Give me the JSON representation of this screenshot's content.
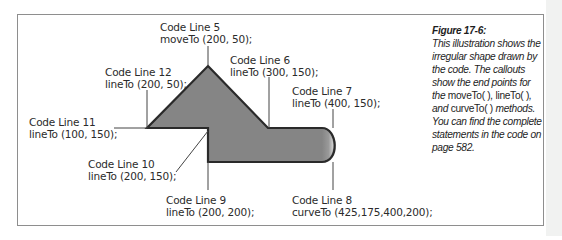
{
  "figure": {
    "title": "Figure 17-6:",
    "caption_parts": [
      "This illustration shows the irregular shape drawn by the code. The callouts show the end points for the ",
      "moveTo( )",
      ", ",
      "lineTo( )",
      ", and ",
      "curveTo( )",
      " methods. You can find the complete statements in the code on page 582."
    ]
  },
  "callouts": [
    {
      "line": "Code Line 5",
      "code": "moveTo (200, 50);"
    },
    {
      "line": "Code Line 6",
      "code": "lineTo (300, 150);"
    },
    {
      "line": "Code Line 7",
      "code": "lineTo (400, 150);"
    },
    {
      "line": "Code Line 8",
      "code": "curveTo (425,175,400,200);"
    },
    {
      "line": "Code Line 9",
      "code": "lineTo (200, 200);"
    },
    {
      "line": "Code Line 10",
      "code": "lineTo (200, 150);"
    },
    {
      "line": "Code Line 11",
      "code": "lineTo (100, 150);"
    },
    {
      "line": "Code Line 12",
      "code": "lineTo (200, 50);"
    }
  ],
  "colors": {
    "shape_fill": "#858585",
    "shape_stroke": "#2a2a2a",
    "leader": "#444444",
    "frame": "#8e8e8e"
  }
}
